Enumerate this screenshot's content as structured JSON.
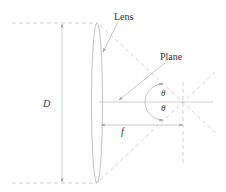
{
  "diagram": {
    "type": "optics-lens-focal-plane",
    "labels": {
      "lens": "Lens",
      "plane": "Plane",
      "diameter": "D",
      "focal_length": "f",
      "angle_top": "θ",
      "angle_bottom": "θ"
    },
    "colors": {
      "stroke": "#b8b8b8",
      "dashed": "#c8c8c8",
      "text": "#333333"
    }
  }
}
